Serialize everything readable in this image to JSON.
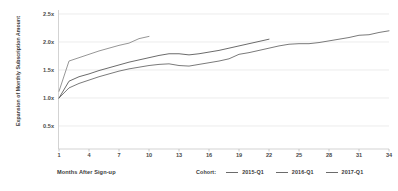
{
  "chart_data": {
    "type": "line",
    "title": "",
    "xlabel": "Months After Sign-up",
    "ylabel": "Expansion of Monthly Subscription Amount",
    "xlim": [
      1,
      34
    ],
    "ylim": [
      0.35,
      2.5
    ],
    "grid": true,
    "legend_position": "bottom-right",
    "legend_title": "Cohort:",
    "x_ticks": [
      "1",
      "4",
      "7",
      "10",
      "13",
      "16",
      "19",
      "22",
      "25",
      "28",
      "31",
      "34"
    ],
    "y_ticks": [
      "2.5x",
      "2.0x",
      "1.5x",
      "1.0x",
      "0.5x"
    ],
    "y_tick_values": [
      2.5,
      2.0,
      1.5,
      1.0,
      0.5
    ],
    "series": [
      {
        "name": "2015-Q1",
        "color": "#6b6b6b",
        "x": [
          1,
          2,
          3,
          4,
          5,
          6,
          7,
          8,
          9,
          10,
          11,
          12,
          13,
          14,
          15,
          16,
          17,
          18,
          19,
          20,
          21,
          22,
          23,
          24,
          25,
          26,
          27,
          28,
          29,
          30,
          31,
          32,
          33,
          34
        ],
        "values": [
          1.0,
          1.18,
          1.26,
          1.32,
          1.38,
          1.43,
          1.48,
          1.52,
          1.55,
          1.58,
          1.6,
          1.61,
          1.58,
          1.57,
          1.6,
          1.63,
          1.66,
          1.7,
          1.78,
          1.81,
          1.85,
          1.89,
          1.93,
          1.96,
          1.97,
          1.97,
          1.99,
          2.02,
          2.05,
          2.08,
          2.12,
          2.13,
          2.17,
          2.2
        ]
      },
      {
        "name": "2016-Q1",
        "color": "#5a5a5a",
        "x": [
          1,
          2,
          3,
          4,
          5,
          6,
          7,
          8,
          9,
          10,
          11,
          12,
          13,
          14,
          15,
          16,
          17,
          18,
          19,
          20,
          21,
          22
        ],
        "values": [
          1.0,
          1.3,
          1.38,
          1.43,
          1.49,
          1.54,
          1.59,
          1.64,
          1.68,
          1.72,
          1.76,
          1.79,
          1.79,
          1.77,
          1.79,
          1.82,
          1.85,
          1.89,
          1.93,
          1.97,
          2.01,
          2.05
        ]
      },
      {
        "name": "2017-Q1",
        "color": "#8a8a8a",
        "x": [
          1,
          2,
          3,
          4,
          5,
          6,
          7,
          8,
          9,
          10
        ],
        "values": [
          1.12,
          1.66,
          1.72,
          1.78,
          1.84,
          1.89,
          1.94,
          1.98,
          2.06,
          2.1
        ]
      }
    ]
  }
}
